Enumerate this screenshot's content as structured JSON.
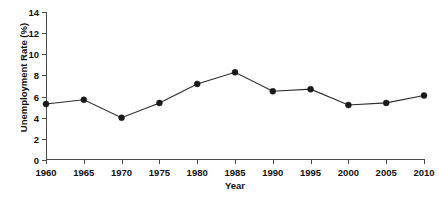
{
  "chart_data": {
    "type": "line",
    "title": "",
    "xlabel": "Year",
    "ylabel": "Unemployment Rate (%)",
    "x": [
      1960,
      1965,
      1970,
      1975,
      1980,
      1985,
      1990,
      1995,
      2000,
      2005,
      2010
    ],
    "values": [
      5.3,
      5.7,
      4.0,
      5.4,
      7.2,
      8.3,
      6.5,
      6.7,
      5.2,
      5.4,
      6.1
    ],
    "xtick_labels": [
      "1960",
      "1965",
      "1970",
      "1975",
      "1980",
      "1985",
      "1990",
      "1995",
      "2000",
      "2005",
      "2010"
    ],
    "ytick_labels": [
      "0",
      "2",
      "4",
      "6",
      "8",
      "10",
      "12",
      "14"
    ],
    "yticks": [
      0,
      2,
      4,
      6,
      8,
      10,
      12,
      14
    ],
    "xlim": [
      1960,
      2010
    ],
    "ylim": [
      0,
      14
    ],
    "grid": false,
    "legend": null,
    "marker": "filled-circle",
    "line_color": "#2b2b2b",
    "marker_color": "#1a1a1a",
    "axis_color": "#4a4a4a",
    "background": "#ffffff"
  }
}
